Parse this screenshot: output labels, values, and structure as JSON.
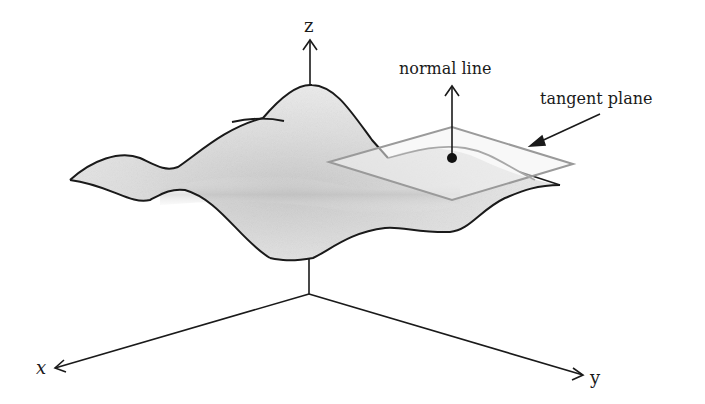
{
  "diagram": {
    "labels": {
      "z_axis": "z",
      "x_axis": "x",
      "y_axis": "y",
      "normal_line": "normal line",
      "tangent_plane": "tangent plane"
    },
    "colors": {
      "ink": "#1a1a1a",
      "surface_fill": "#e6e6e6",
      "surface_shadow": "#bdbdbd",
      "plane_edge": "#9a9a9a",
      "plane_fill": "#f0f0f0"
    }
  }
}
